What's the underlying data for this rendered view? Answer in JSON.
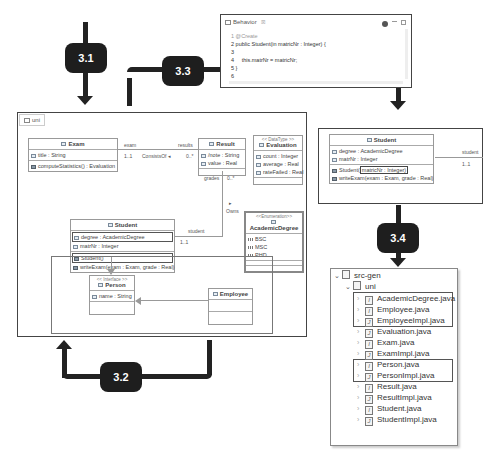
{
  "badges": {
    "b31": "3.1",
    "b32": "3.2",
    "b33": "3.3",
    "b34": "3.4"
  },
  "behavior_editor": {
    "title": "Behavior",
    "tab_marker": "☒",
    "lines": [
      "1 @Create",
      "2 public Student(in matricNr : Integer) {",
      "3",
      "4     this.matrNr = matricNr;",
      "5 }",
      "6"
    ]
  },
  "main_diagram": {
    "package_tab": "uni",
    "exam": {
      "name": "Exam",
      "attributes": [
        "title : String"
      ],
      "operations": [
        "computeStatistics() : Evaluation"
      ]
    },
    "result": {
      "name": "Result",
      "attributes": [
        "/note : String",
        "value : Real"
      ]
    },
    "evaluation": {
      "stereotype": "<< DataType >>",
      "name": "Evaluation",
      "attributes": [
        "count : Integer",
        "average : Real",
        "rateFailed : Real"
      ]
    },
    "academic_degree": {
      "stereotype": "<<Enumeration>>",
      "name": "AcademicDegree",
      "literals": [
        "BSC",
        "MSC",
        "PHD"
      ]
    },
    "student": {
      "name": "Student",
      "attributes": [
        "degree : AcademicDegree",
        "matrNr : Integer"
      ],
      "operations": [
        "Student()",
        "writeExam(exam : Exam, grade : Real)"
      ]
    },
    "person": {
      "stereotype": "<< Interface >>",
      "name": "Person",
      "attributes": [
        "name : String"
      ]
    },
    "employee": {
      "name": "Employee"
    },
    "associations": {
      "exam_role": "exam",
      "exam_mult": "1..1",
      "consists_of": "ConsistsOf ◂",
      "results_role": "results",
      "results_mult": "0..*",
      "grades_role": "grades",
      "grades_mult": "0..*",
      "owns": "Owns",
      "owns_arrow": "▸",
      "student_role": "student",
      "student_mult": "1..1"
    }
  },
  "student_detail": {
    "name": "Student",
    "attributes": [
      "degree : AcademicDegree",
      "matrNr : Integer"
    ],
    "operations": [
      "Student(matricNr : Integer)",
      "writeExam(exam : Exam, grade : Real)"
    ],
    "op_prefix": "Student(",
    "op_param": "matricNr : Integer)",
    "student_role": "student",
    "student_mult": "1..1"
  },
  "project_tree": {
    "root": "src-gen",
    "package": "uni",
    "files": [
      "AcademicDegree.java",
      "Employee.java",
      "EmployeeImpl.java",
      "Evaluation.java",
      "Exam.java",
      "ExamImpl.java",
      "Person.java",
      "PersonImpl.java",
      "Result.java",
      "ResultImpl.java",
      "Student.java",
      "StudentImpl.java"
    ]
  }
}
